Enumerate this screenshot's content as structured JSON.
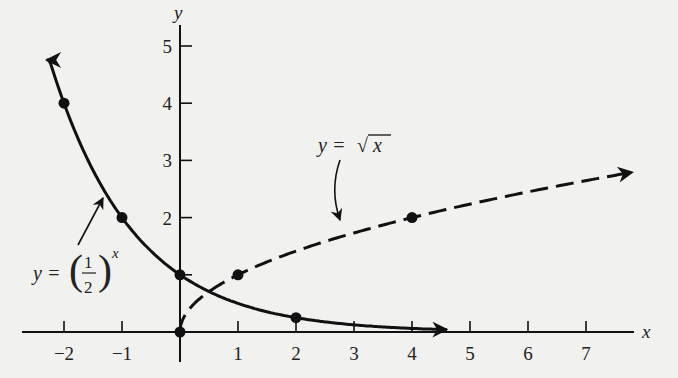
{
  "chart_data": {
    "type": "line",
    "title": "",
    "xlabel": "x",
    "ylabel": "y",
    "xlim": [
      -2.6,
      7.8
    ],
    "ylim": [
      0,
      5.3
    ],
    "grid": false,
    "legend": "none (curves labeled by annotations)",
    "x_ticks": [
      -2,
      -1,
      1,
      2,
      3,
      4,
      5,
      6,
      7
    ],
    "x_tick_labels": [
      "−2",
      "−1",
      "1",
      "2",
      "3",
      "4",
      "5",
      "6",
      "7"
    ],
    "y_ticks": [
      2,
      3,
      4,
      5
    ],
    "y_tick_labels": [
      "2",
      "3",
      "4",
      "5"
    ],
    "series": [
      {
        "name": "y = (1/2)^x",
        "style": "solid",
        "expression": "(1/2)^x",
        "x_range": [
          -2.3,
          4.6
        ],
        "points": [
          {
            "x": -2,
            "y": 4
          },
          {
            "x": -1,
            "y": 2
          },
          {
            "x": 0,
            "y": 1
          },
          {
            "x": 2,
            "y": 0.25
          }
        ],
        "arrows": [
          "left",
          "right"
        ]
      },
      {
        "name": "y = √x",
        "style": "dashed",
        "expression": "sqrt(x)",
        "x_range": [
          0,
          7.8
        ],
        "points": [
          {
            "x": 0,
            "y": 0
          },
          {
            "x": 1,
            "y": 1
          },
          {
            "x": 4,
            "y": 2
          }
        ],
        "arrows": [
          "right"
        ]
      }
    ],
    "annotations": [
      {
        "text": "y = (1/2)^x",
        "label_prefix": "y =",
        "fraction_num": "1",
        "fraction_den": "2",
        "exponent": "x",
        "points_to": {
          "x": -1.3,
          "y": 2.5
        }
      },
      {
        "text": "y = √x",
        "label_prefix": "y =",
        "radical": "√",
        "radicand": "x",
        "points_to": {
          "x": 2.7,
          "y": 1.65
        }
      }
    ]
  },
  "axes": {
    "x_label": "x",
    "y_label": "y"
  }
}
